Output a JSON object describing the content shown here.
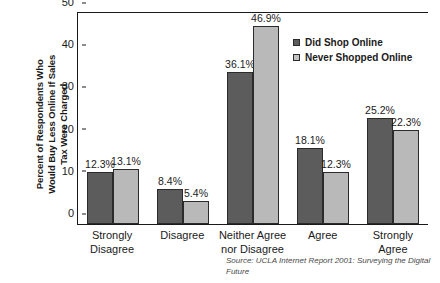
{
  "chart_data": {
    "type": "bar",
    "title": "",
    "xlabel": "",
    "ylabel": "Percent of Respondents Who\nWould Buy Less Online If Sales\nTax Were Charged",
    "ylim": [
      0,
      50
    ],
    "yticks": [
      0,
      10,
      20,
      30,
      40,
      50
    ],
    "grid": false,
    "legend_position": "top-right",
    "categories": [
      "Strongly\nDisagree",
      "Disagree",
      "Neither Agree\nnor Disagree",
      "Agree",
      "Strongly Agree"
    ],
    "series": [
      {
        "name": "Did Shop Online",
        "color": "#5c5c5c",
        "values": [
          12.3,
          8.4,
          36.1,
          18.1,
          25.2
        ],
        "labels": [
          "12.3%",
          "8.4%",
          "36.1%",
          "18.1%",
          "25.2%"
        ]
      },
      {
        "name": "Never Shopped Online",
        "color": "#b9b9b9",
        "values": [
          13.1,
          5.4,
          46.9,
          12.3,
          22.3
        ],
        "labels": [
          "13.1%",
          "5.4%",
          "46.9%",
          "12.3%",
          "22.3%"
        ]
      }
    ],
    "annotations": [
      "Source: UCLA Internet Report 2001: Surveying the Digital Future"
    ]
  },
  "source_note": "Source: UCLA Internet Report 2001: Surveying the Digital Future",
  "ytick_labels": [
    "50",
    "40",
    "30",
    "20",
    "10",
    "0"
  ]
}
